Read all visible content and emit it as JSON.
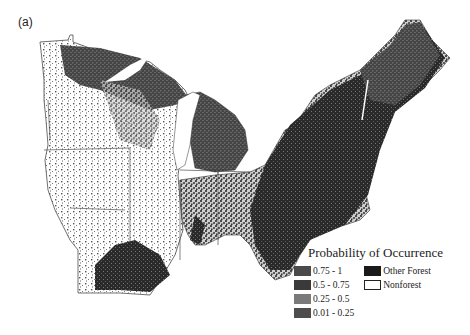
{
  "figure": {
    "panel_label": "(a)",
    "colors": {
      "background": "#ffffff",
      "outline": "#333333",
      "water": "#ffffff"
    }
  },
  "legend": {
    "title": "Probability of Occurrence",
    "probability_classes": [
      {
        "label": "0.75 - 1",
        "color": "#4a4a4a"
      },
      {
        "label": "0.5 - 0.75",
        "color": "#3a3a3a"
      },
      {
        "label": "0.25 - 0.5",
        "color": "#7a7a7a"
      },
      {
        "label": "0.01 - 0.25",
        "color": "#4d4d4d"
      }
    ],
    "cover_classes": [
      {
        "label": "Other Forest",
        "color": "#1a1a1a"
      },
      {
        "label": "Nonforest",
        "color": "#ffffff"
      }
    ]
  }
}
